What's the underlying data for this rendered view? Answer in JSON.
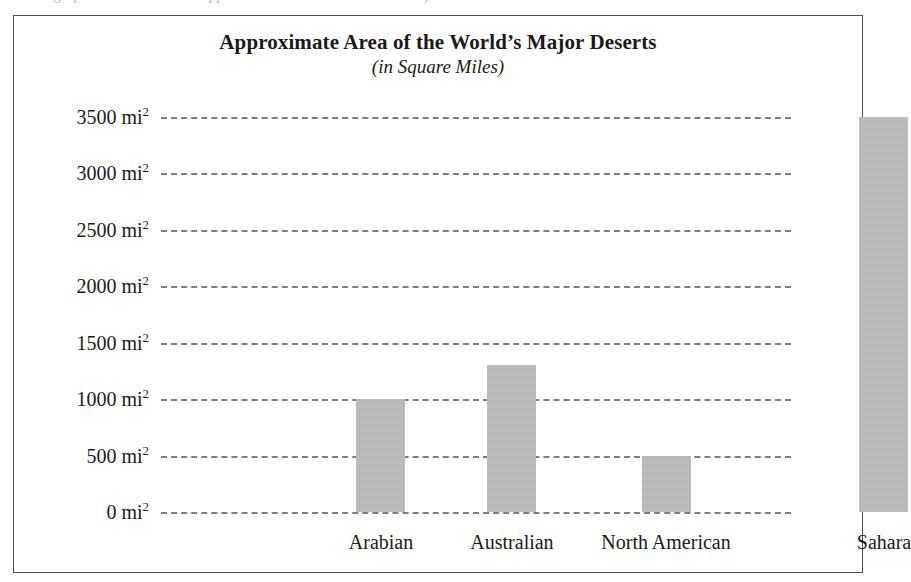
{
  "figure": {
    "title": "Approximate Area of the World’s Major Deserts",
    "subtitle": "(in Square Miles)",
    "cropped_text_above": "the graph below shows the approximate area of the world’s major deserts"
  },
  "axis": {
    "unit_number_suffix": " mi",
    "unit_exponent": "2",
    "y_tick_labels": [
      "0 mi",
      "500 mi",
      "1000 mi",
      "1500 mi",
      "2000 mi",
      "2500 mi",
      "3000 mi",
      "3500 mi"
    ]
  },
  "colors": {
    "bar_fill": "#b2b2b2",
    "gridline": "#7d7d7d",
    "frame_border": "#4d4d4d",
    "text": "#1a1a1a"
  },
  "chart_data": {
    "type": "bar",
    "title": "Approximate Area of the World’s Major Deserts",
    "subtitle": "(in Square Miles)",
    "xlabel": "",
    "ylabel": "mi2",
    "categories": [
      "Arabian",
      "Australian",
      "North American",
      "Sahara"
    ],
    "values": [
      1000,
      1300,
      500,
      3500
    ],
    "value_labels": [
      "1000 mi2",
      "1300 mi2",
      "500 mi2",
      "3500 mi2"
    ],
    "ylim": [
      0,
      3500
    ],
    "y_ticks": [
      0,
      500,
      1000,
      1500,
      2000,
      2500,
      3000,
      3500
    ],
    "y_tick_labels": [
      "0 mi2",
      "500 mi2",
      "1000 mi2",
      "1500 mi2",
      "2000 mi2",
      "2500 mi2",
      "3000 mi2",
      "3500 mi2"
    ],
    "grid": true,
    "grid_style": "dashed",
    "grid_axis": "y",
    "legend": false,
    "legend_position": "none",
    "bar_color": "#b2b2b2",
    "orientation": "vertical"
  }
}
